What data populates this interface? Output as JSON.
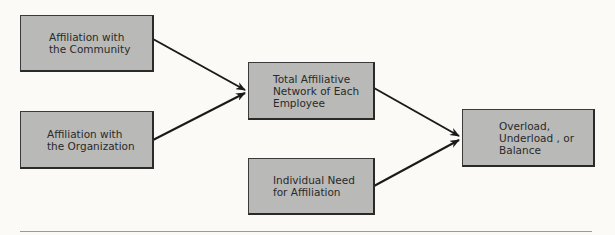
{
  "diagram": {
    "nodes": [
      {
        "id": "community",
        "label": "Affiliation with\nthe Community"
      },
      {
        "id": "organization",
        "label": "Affiliation with\nthe Organization"
      },
      {
        "id": "total",
        "label": "Total Affiliative\nNetwork of Each\nEmployee"
      },
      {
        "id": "need",
        "label": "Individual Need\nfor Affiliation"
      },
      {
        "id": "outcome",
        "label": "Overload,\nUnderload , or\nBalance"
      }
    ],
    "edges": [
      {
        "from": "community",
        "to": "total"
      },
      {
        "from": "organization",
        "to": "total"
      },
      {
        "from": "total",
        "to": "outcome"
      },
      {
        "from": "need",
        "to": "outcome"
      }
    ],
    "colors": {
      "box_fill": "#b9b9b7",
      "border": "#2a2a2a",
      "background": "#fbfaf6"
    }
  }
}
